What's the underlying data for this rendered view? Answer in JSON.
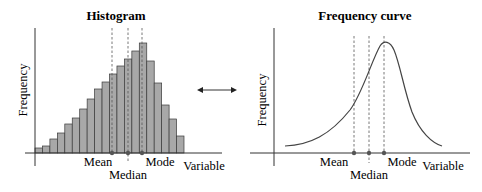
{
  "left_panel": {
    "title": "Histogram",
    "y_label": "Frequency",
    "x_label": "Variable",
    "markers": {
      "mean": "Mean",
      "median": "Median",
      "mode": "Mode"
    }
  },
  "right_panel": {
    "title": "Frequency curve",
    "y_label": "Frequency",
    "x_label": "Variable",
    "markers": {
      "mean": "Mean",
      "median": "Median",
      "mode": "Mode"
    }
  },
  "connector": {
    "icon": "double-headed-arrow-icon"
  },
  "colors": {
    "bar_fill": "#a8a8a8",
    "bar_stroke": "#3a3a3a",
    "axis": "#333333",
    "dashed": "#555555",
    "curve": "#444444"
  },
  "chart_data": [
    {
      "type": "bar",
      "title": "Histogram",
      "xlabel": "Variable",
      "ylabel": "Frequency",
      "categories": [
        "1",
        "2",
        "3",
        "4",
        "5",
        "6",
        "7",
        "8",
        "9",
        "10",
        "11",
        "12",
        "13",
        "14",
        "15",
        "16",
        "17",
        "18",
        "19",
        "20"
      ],
      "values": [
        5,
        7,
        14,
        20,
        29,
        35,
        44,
        54,
        64,
        71,
        79,
        87,
        94,
        102,
        110,
        92,
        70,
        48,
        34,
        17
      ],
      "annotations": [
        {
          "label": "Mean",
          "bar_position": 10.4
        },
        {
          "label": "Median",
          "bar_position": 12.5
        },
        {
          "label": "Mode",
          "bar_position": 14.5
        }
      ],
      "skew": "negative (left-skewed)",
      "grid": false
    },
    {
      "type": "line",
      "title": "Frequency curve",
      "xlabel": "Variable",
      "ylabel": "Frequency",
      "x": [
        0,
        10,
        20,
        30,
        40,
        50,
        60,
        66,
        70,
        75,
        80,
        90,
        100
      ],
      "y": [
        7,
        10,
        16,
        25,
        40,
        62,
        90,
        103,
        110,
        102,
        70,
        20,
        7
      ],
      "annotations": [
        {
          "label": "Mean",
          "x": 46
        },
        {
          "label": "Median",
          "x": 56
        },
        {
          "label": "Mode",
          "x": 66
        }
      ],
      "skew": "negative (left-skewed)",
      "grid": false
    }
  ]
}
